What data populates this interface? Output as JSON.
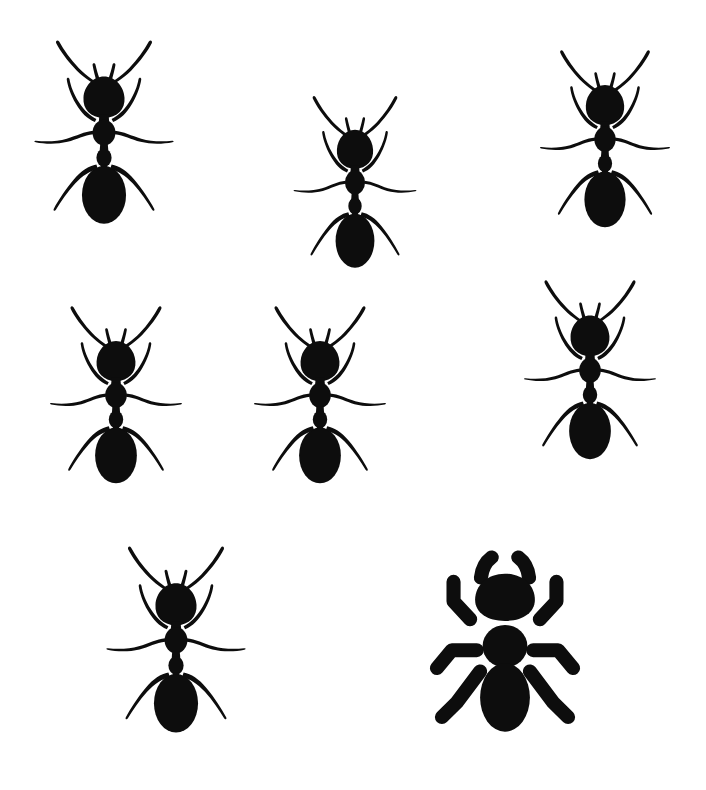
{
  "image": {
    "title": "Ant silhouette collection",
    "background_color": "#ffffff",
    "ink_color": "#0d0d0d",
    "width": 706,
    "height": 790,
    "subject_count": 8,
    "style_note": "seven detailed realistic ant silhouettes plus one simplified chunky icon ant"
  },
  "ants": [
    {
      "id": "ant-top-left",
      "label": "Detailed ant, top-left",
      "style": "detailed",
      "x": 28,
      "y": 34,
      "width": 152,
      "height": 205,
      "rotation": 0
    },
    {
      "id": "ant-top-center",
      "label": "Detailed ant, top-center",
      "style": "detailed",
      "x": 288,
      "y": 90,
      "width": 134,
      "height": 192,
      "rotation": 0
    },
    {
      "id": "ant-top-right",
      "label": "Detailed ant, top-right",
      "style": "detailed",
      "x": 534,
      "y": 44,
      "width": 142,
      "height": 198,
      "rotation": 0
    },
    {
      "id": "ant-middle-left",
      "label": "Detailed ant, middle-left",
      "style": "detailed",
      "x": 44,
      "y": 300,
      "width": 144,
      "height": 198,
      "rotation": 0
    },
    {
      "id": "ant-middle-center",
      "label": "Detailed ant, middle-center",
      "style": "detailed",
      "x": 248,
      "y": 300,
      "width": 144,
      "height": 198,
      "rotation": 0
    },
    {
      "id": "ant-middle-right",
      "label": "Detailed ant, middle-right",
      "style": "detailed",
      "x": 518,
      "y": 274,
      "width": 144,
      "height": 200,
      "rotation": 0
    },
    {
      "id": "ant-bottom-left",
      "label": "Detailed ant, bottom-left",
      "style": "detailed",
      "x": 100,
      "y": 540,
      "width": 152,
      "height": 208,
      "rotation": 0
    },
    {
      "id": "ant-bottom-right-icon",
      "label": "Simplified icon ant, bottom-right",
      "style": "simplified",
      "x": 422,
      "y": 528,
      "width": 166,
      "height": 220,
      "rotation": 0
    }
  ]
}
